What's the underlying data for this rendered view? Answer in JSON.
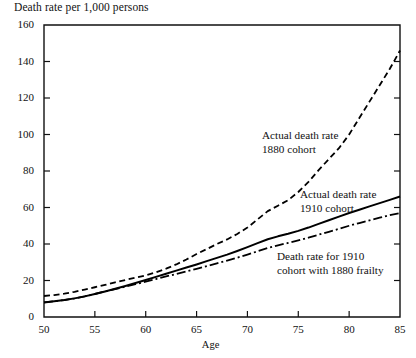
{
  "chart_data": {
    "type": "line",
    "title": "Death rate per 1,000 persons",
    "xlabel": "Age",
    "ylabel": "Death rate per 1,000 persons",
    "xlim": [
      50,
      85
    ],
    "ylim": [
      0,
      160
    ],
    "xticks": [
      50,
      55,
      60,
      65,
      70,
      75,
      80,
      85
    ],
    "yticks": [
      0,
      20,
      40,
      60,
      80,
      100,
      120,
      140,
      160
    ],
    "grid": false,
    "legend_position": "inline-annotations",
    "annotations": [
      {
        "name": "annotation-1880-cohort",
        "line1": "Actual death rate",
        "line2": "1880 cohort",
        "x": 262,
        "y": 129
      },
      {
        "name": "annotation-1910-cohort",
        "line1": "Actual death rate",
        "line2": "1910 cohort",
        "x": 300,
        "y": 188
      },
      {
        "name": "annotation-1910-frailty",
        "line1": "Death rate for 1910",
        "line2": "cohort with 1880 frailty",
        "x": 277,
        "y": 250
      }
    ],
    "series": [
      {
        "name": "Actual death rate 1880 cohort",
        "style": "dashed",
        "color": "#000000",
        "x": [
          50,
          51,
          52,
          53,
          54,
          55,
          56,
          57,
          58,
          59,
          60,
          61,
          62,
          63,
          64,
          65,
          66,
          67,
          68,
          69,
          70,
          71,
          72,
          73,
          74,
          75,
          76,
          77,
          78,
          79,
          80,
          81,
          82,
          83,
          84,
          85
        ],
        "values": [
          11.5,
          12.0,
          12.8,
          13.8,
          15.0,
          16.3,
          17.6,
          19.0,
          20.3,
          21.5,
          22.8,
          24.5,
          26.5,
          28.8,
          31.5,
          34.5,
          37.2,
          40.0,
          42.5,
          45.5,
          49.0,
          53.5,
          58.0,
          61.0,
          64.0,
          68.5,
          74.0,
          80.5,
          86.5,
          92.5,
          100.0,
          109.0,
          118.0,
          127.0,
          136.0,
          146.0
        ]
      },
      {
        "name": "Actual death rate 1910 cohort",
        "style": "solid",
        "color": "#000000",
        "x": [
          50,
          51,
          52,
          53,
          54,
          55,
          56,
          57,
          58,
          59,
          60,
          61,
          62,
          63,
          64,
          65,
          66,
          67,
          68,
          69,
          70,
          71,
          72,
          73,
          74,
          75,
          76,
          77,
          78,
          79,
          80,
          81,
          82,
          83,
          84,
          85
        ],
        "values": [
          8.0,
          8.6,
          9.3,
          10.2,
          11.3,
          12.6,
          14.0,
          15.5,
          17.0,
          18.6,
          20.3,
          22.0,
          23.7,
          25.4,
          27.1,
          28.8,
          30.6,
          32.4,
          34.2,
          36.2,
          38.3,
          40.5,
          42.6,
          44.2,
          45.6,
          47.2,
          49.0,
          51.0,
          53.0,
          55.0,
          57.0,
          58.8,
          60.6,
          62.4,
          64.2,
          66.0
        ]
      },
      {
        "name": "Death rate for 1910 cohort with 1880 frailty",
        "style": "dash-dot",
        "color": "#000000",
        "x": [
          50,
          51,
          52,
          53,
          54,
          55,
          56,
          57,
          58,
          59,
          60,
          61,
          62,
          63,
          64,
          65,
          66,
          67,
          68,
          69,
          70,
          71,
          72,
          73,
          74,
          75,
          76,
          77,
          78,
          79,
          80,
          81,
          82,
          83,
          84,
          85
        ],
        "values": [
          8.0,
          8.6,
          9.3,
          10.2,
          11.3,
          12.6,
          14.0,
          15.3,
          16.6,
          18.0,
          19.4,
          20.8,
          22.2,
          23.6,
          25.0,
          26.4,
          27.9,
          29.4,
          30.9,
          32.5,
          34.2,
          36.0,
          37.8,
          39.3,
          40.6,
          42.0,
          43.5,
          45.1,
          46.7,
          48.3,
          50.0,
          51.5,
          53.0,
          54.4,
          55.8,
          57.0
        ]
      }
    ]
  }
}
